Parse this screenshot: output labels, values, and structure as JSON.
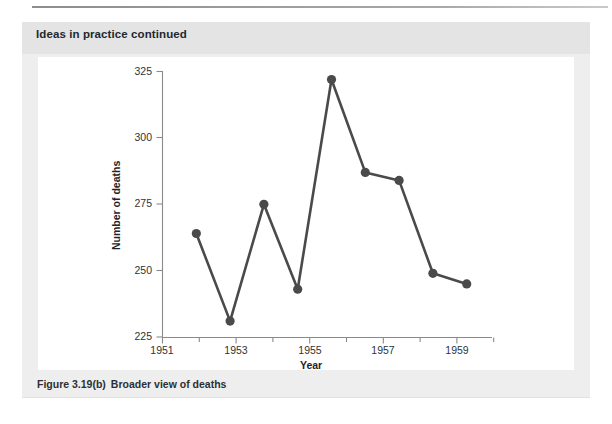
{
  "header": {
    "title": "Ideas in practice continued"
  },
  "caption": {
    "number": "Figure 3.19(b)",
    "text": "Broader view of deaths"
  },
  "colors": {
    "page_background": "#ffffff",
    "figure_box": "#eeeeee",
    "header_band": "#e4e4e4",
    "plot_panel": "#ffffff",
    "series": "#4a4a4c",
    "axis": "#8a8a8a",
    "text": "#2b3034"
  },
  "chart_data": {
    "type": "line",
    "title": "",
    "xlabel": "Year",
    "ylabel": "Number of deaths",
    "x": [
      1952,
      1953,
      1954,
      1955,
      1956,
      1957,
      1958,
      1959,
      1960
    ],
    "values": [
      264,
      231,
      275,
      243,
      322,
      287,
      284,
      249,
      245
    ],
    "series": [
      {
        "name": "Number of deaths",
        "values": [
          264,
          231,
          275,
          243,
          322,
          287,
          284,
          249,
          245
        ]
      }
    ],
    "xlim": [
      1951,
      1960.8
    ],
    "ylim": [
      225,
      325
    ],
    "ytick_labels": [
      "225",
      "250",
      "275",
      "300",
      "325"
    ],
    "ytick_values": [
      225,
      250,
      275,
      300,
      325
    ],
    "xtick_labels": [
      "1951",
      "1953",
      "1955",
      "1957",
      "1959"
    ],
    "xtick_values": [
      1951,
      1953,
      1955,
      1957,
      1959
    ],
    "xminor_ticks": [
      1952,
      1954,
      1956,
      1958,
      1960
    ],
    "grid": false,
    "legend": "none",
    "markers": "filled-circle"
  }
}
